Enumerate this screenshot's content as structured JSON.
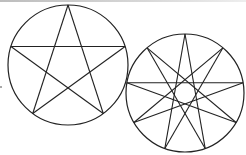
{
  "figure": {
    "stroke_color": "#222222",
    "background": "#ffffff",
    "shapes": [
      {
        "name": "pentagram",
        "points": 5,
        "step": 2,
        "cx": 68,
        "cy": 65,
        "r": 60
      },
      {
        "name": "nonagram",
        "points": 9,
        "step": 4,
        "cx": 185,
        "cy": 93,
        "r": 59
      }
    ]
  }
}
